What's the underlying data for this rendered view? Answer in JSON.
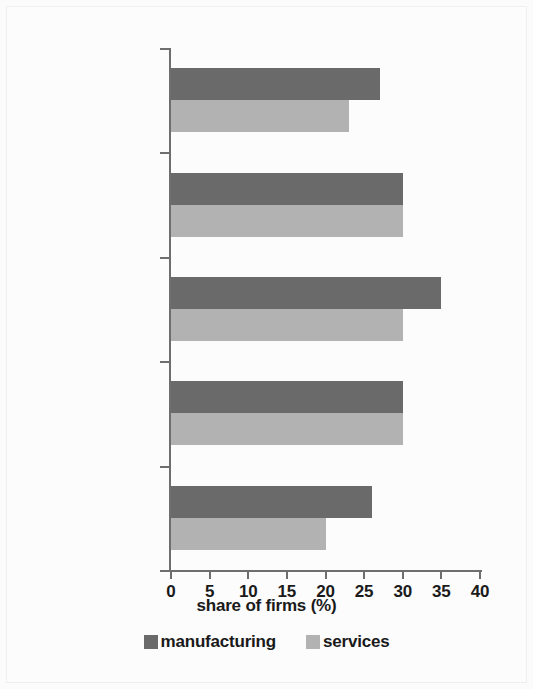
{
  "chart_data": {
    "type": "bar",
    "orientation": "horizontal",
    "title": "",
    "xlabel": "share of firms (%)",
    "ylabel": "",
    "xlim": [
      0,
      40
    ],
    "xticks": [
      0,
      5,
      10,
      15,
      20,
      25,
      30,
      35,
      40
    ],
    "xticklabels": [
      "0",
      "5",
      "10",
      "15",
      "20",
      "25",
      "30",
      "35",
      "40"
    ],
    "grid": false,
    "legend_position": "bottom-center",
    "categories": [
      "too few locally\ntrained students",
      "low quality\nlocal training",
      "job\nturnover",
      "low starting\nwages",
      "emigration of\nskilled workers"
    ],
    "category_lines": [
      [
        "too few locally",
        "trained students"
      ],
      [
        "low quality",
        "local training"
      ],
      [
        "job",
        "turnover"
      ],
      [
        "low starting",
        "wages"
      ],
      [
        "emigration of",
        "skilled workers"
      ]
    ],
    "series": [
      {
        "name": "manufacturing",
        "color": "#6a6a6a",
        "values": [
          27,
          30,
          35,
          30,
          26
        ]
      },
      {
        "name": "services",
        "color": "#b2b2b2",
        "values": [
          23,
          30,
          30,
          30,
          20
        ]
      }
    ]
  },
  "legend": {
    "items": [
      {
        "label": "manufacturing",
        "color": "#6a6a6a"
      },
      {
        "label": "services",
        "color": "#b2b2b2"
      }
    ]
  },
  "axis": {
    "x_title": "share of firms (%)",
    "tick_color": "#6e6e6e"
  }
}
